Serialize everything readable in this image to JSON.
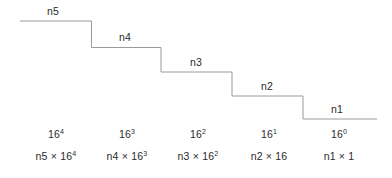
{
  "diagram": {
    "line_color": "#9a9a9a",
    "text_color": "#2b2b2b",
    "background_color": "#ffffff",
    "steps": [
      {
        "id": "step-5",
        "label": "n5",
        "power_label_base": "16",
        "power_label_exponent": "4",
        "product_label": "n5 × 16",
        "product_label_exponent": "4",
        "tread_x_start": 20,
        "tread_x_end": 91.5,
        "tread_y": 21,
        "label_center_x": 53,
        "label_y": 5,
        "column_center_x": 56
      },
      {
        "id": "step-4",
        "label": "n4",
        "power_label_base": "16",
        "power_label_exponent": "3",
        "product_label": "n4 × 16",
        "product_label_exponent": "3",
        "tread_x_start": 91.5,
        "tread_x_end": 161,
        "tread_y": 47.5,
        "label_center_x": 125,
        "label_y": 31,
        "column_center_x": 127
      },
      {
        "id": "step-3",
        "label": "n3",
        "power_label_base": "16",
        "power_label_exponent": "2",
        "product_label": "n3 × 16",
        "product_label_exponent": "2",
        "tread_x_start": 161,
        "tread_x_end": 232,
        "tread_y": 72,
        "label_center_x": 196,
        "label_y": 56,
        "column_center_x": 198
      },
      {
        "id": "step-2",
        "label": "n2",
        "power_label_base": "16",
        "power_label_exponent": "1",
        "product_label": "n2 × 16",
        "product_label_exponent": "",
        "tread_x_start": 232,
        "tread_x_end": 303,
        "tread_y": 96,
        "label_center_x": 267,
        "label_y": 80,
        "column_center_x": 269
      },
      {
        "id": "step-1",
        "label": "n1",
        "power_label_base": "16",
        "power_label_exponent": "0",
        "product_label": "n1 × 1",
        "product_label_exponent": "",
        "tread_x_start": 303,
        "tread_x_end": 377,
        "tread_y": 119,
        "label_center_x": 337,
        "label_y": 103,
        "column_center_x": 339
      }
    ],
    "polyline_points": "20,21 91.5,21 91.5,47.5 161,47.5 161,72 232,72 232,96 303,96 303,119 377,119"
  }
}
